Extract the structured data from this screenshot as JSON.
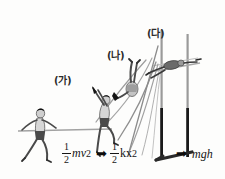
{
  "diagram": {
    "background_color": "#fdfdfc",
    "ink_color": "#2b2b2b"
  },
  "stages": [
    {
      "id": "ga",
      "label": "(가)",
      "description": "Athlete running with horizontal pole",
      "energy_label": "kinetic"
    },
    {
      "id": "na",
      "label": "(나)",
      "description": "Athlete inverted on bending pole",
      "energy_label": "elastic"
    },
    {
      "id": "da",
      "label": "(다)",
      "description": "Athlete clearing the crossbar",
      "energy_label": "gravitational"
    }
  ],
  "formulas": {
    "kinetic": {
      "numerator": "1",
      "denominator": "2",
      "mass": "m",
      "variable": "v",
      "exponent": "2"
    },
    "elastic": {
      "numerator": "1",
      "denominator": "2",
      "constant": "k",
      "variable": "x",
      "exponent": "2"
    },
    "gravitational": {
      "text": "mgh"
    }
  },
  "arrows": {
    "first": "➡",
    "second": "➡"
  },
  "colors": {
    "pole": "#8a8a8a",
    "standard_upper": "#9a9a9a",
    "standard_lower": "#1a1a1a",
    "figure_outline": "#3a3a3a",
    "figure_shade": "#b5b5b5",
    "hair": "#111111",
    "shorts": "#4a4a4a"
  }
}
